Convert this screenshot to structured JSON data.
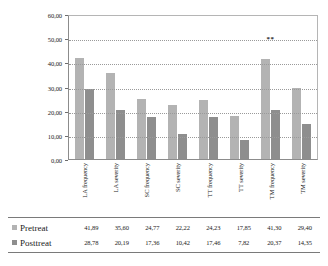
{
  "chart_data": {
    "type": "bar",
    "title": "",
    "subtitle": "",
    "xlabel": "",
    "ylabel": "",
    "ylim": [
      0,
      60
    ],
    "yticks": [
      "0,00",
      "10,00",
      "20,00",
      "30,00",
      "40,00",
      "50,00",
      "60,00"
    ],
    "ytick_values": [
      0,
      10,
      20,
      30,
      40,
      50,
      60
    ],
    "grid": "horizontal-dotted",
    "legend_position": "bottom-table",
    "categories": [
      "LA frequency",
      "LA severity",
      "SC frequency",
      "SC severity",
      "TT frequency",
      "TT severity",
      "TM frequency",
      "TM severity"
    ],
    "series": [
      {
        "name": "Pretreat",
        "color": "#b3b3b3",
        "values": [
          41.89,
          35.6,
          24.77,
          22.22,
          24.23,
          17.85,
          41.3,
          29.4
        ],
        "labels": [
          "41,89",
          "35,60",
          "24,77",
          "22,22",
          "24,23",
          "17,85",
          "41,30",
          "29,40"
        ]
      },
      {
        "name": "Posttreat",
        "color": "#8e8e8e",
        "values": [
          28.78,
          20.19,
          17.36,
          10.42,
          17.46,
          7.82,
          20.37,
          14.35
        ],
        "labels": [
          "28,78",
          "20,19",
          "17,36",
          "10,42",
          "17,46",
          "7,82",
          "20,37",
          "14,35"
        ]
      }
    ],
    "annotations": [
      {
        "text": "**",
        "category": "TM frequency",
        "y": 48
      }
    ]
  }
}
